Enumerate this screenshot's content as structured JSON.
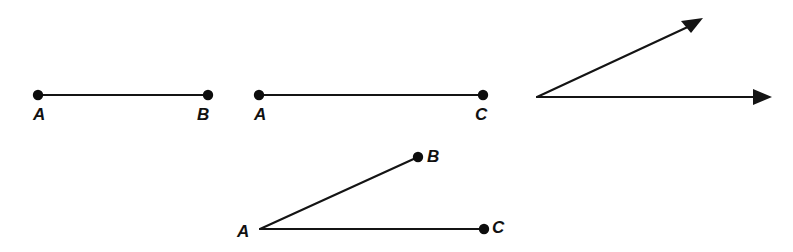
{
  "canvas": {
    "width": 793,
    "height": 252,
    "background": "#ffffff",
    "ink_color": "#141414"
  },
  "figures": [
    {
      "id": "segment-ab",
      "kind": "line-segment",
      "description": "Horizontal line segment with two endpoint dots labeled A and B",
      "labels": [
        {
          "text": "A",
          "x": 33,
          "y": 120
        },
        {
          "text": "B",
          "x": 197,
          "y": 120
        }
      ],
      "points": [
        {
          "name": "A",
          "x": 38,
          "y": 95
        },
        {
          "name": "B",
          "x": 208,
          "y": 95
        }
      ]
    },
    {
      "id": "segment-ac",
      "kind": "line-segment",
      "description": "Horizontal line segment with two endpoint dots labeled A and C",
      "labels": [
        {
          "text": "A",
          "x": 254,
          "y": 120
        },
        {
          "text": "C",
          "x": 475,
          "y": 120
        }
      ],
      "points": [
        {
          "name": "A",
          "x": 259,
          "y": 95
        },
        {
          "name": "C",
          "x": 483,
          "y": 95
        }
      ]
    },
    {
      "id": "angle-rays",
      "kind": "angle-two-rays",
      "description": "Unlabeled angle formed by two rays with arrowheads sharing a common vertex",
      "labels": [],
      "points": [
        {
          "name": "vertex",
          "x": 537,
          "y": 97
        },
        {
          "name": "upper-ray-tip",
          "x": 703,
          "y": 18
        },
        {
          "name": "lower-ray-tip",
          "x": 772,
          "y": 97
        }
      ]
    },
    {
      "id": "angle-bac",
      "kind": "angle-two-segments",
      "description": "Angle BAC with vertex A, upper endpoint B and right endpoint C, all marked with dots",
      "labels": [
        {
          "text": "A",
          "x": 237,
          "y": 237
        },
        {
          "text": "B",
          "x": 427,
          "y": 162
        },
        {
          "text": "C",
          "x": 492,
          "y": 233
        }
      ],
      "points": [
        {
          "name": "A",
          "x": 260,
          "y": 229
        },
        {
          "name": "B",
          "x": 418,
          "y": 157
        },
        {
          "name": "C",
          "x": 484,
          "y": 229
        }
      ]
    }
  ],
  "geometry": {
    "dot_radius": 5.2,
    "line_width": 2.1,
    "label_font_size": 17
  }
}
